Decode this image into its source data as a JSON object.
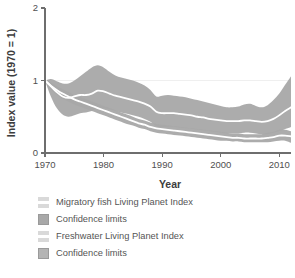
{
  "chart_data": {
    "type": "area",
    "title": "",
    "xlabel": "Year",
    "ylabel": "Index value (1970 = 1)",
    "xlim": [
      1970,
      2012
    ],
    "ylim": [
      0,
      2
    ],
    "xticks": [
      1970,
      1980,
      1990,
      2000,
      2010
    ],
    "xtick_labels": [
      "1970",
      "1980",
      "1990",
      "2000",
      "2010"
    ],
    "yticks": [
      0,
      1,
      2
    ],
    "ytick_labels": [
      "0",
      "1",
      "2"
    ],
    "grid": "horizontal-reference-line-at-1",
    "legend_position": "below",
    "reference_line_y": 1,
    "x": [
      1970,
      1971,
      1972,
      1973,
      1974,
      1975,
      1976,
      1977,
      1978,
      1979,
      1980,
      1981,
      1982,
      1983,
      1984,
      1985,
      1986,
      1987,
      1988,
      1989,
      1990,
      1991,
      1992,
      1993,
      1994,
      1995,
      1996,
      1997,
      1998,
      1999,
      2000,
      2001,
      2002,
      2003,
      2004,
      2005,
      2006,
      2007,
      2008,
      2009,
      2010,
      2011,
      2012
    ],
    "series": [
      {
        "name": "Migratory fish Living Planet Index",
        "type": "line",
        "color": "#ffffff",
        "values": [
          1.0,
          0.92,
          0.84,
          0.78,
          0.76,
          0.78,
          0.8,
          0.8,
          0.82,
          0.86,
          0.85,
          0.82,
          0.79,
          0.77,
          0.75,
          0.73,
          0.71,
          0.68,
          0.64,
          0.57,
          0.55,
          0.55,
          0.55,
          0.54,
          0.53,
          0.52,
          0.5,
          0.49,
          0.47,
          0.46,
          0.45,
          0.44,
          0.44,
          0.44,
          0.45,
          0.45,
          0.44,
          0.43,
          0.44,
          0.47,
          0.52,
          0.58,
          0.63
        ]
      },
      {
        "name": "Confidence limits",
        "type": "band",
        "for": "Migratory fish Living Planet Index",
        "color": "#a8a8a8",
        "lower": [
          1.0,
          0.78,
          0.62,
          0.53,
          0.5,
          0.52,
          0.55,
          0.56,
          0.58,
          0.62,
          0.62,
          0.6,
          0.58,
          0.56,
          0.54,
          0.52,
          0.5,
          0.47,
          0.43,
          0.37,
          0.36,
          0.36,
          0.36,
          0.35,
          0.34,
          0.33,
          0.32,
          0.31,
          0.3,
          0.29,
          0.28,
          0.27,
          0.27,
          0.27,
          0.28,
          0.28,
          0.27,
          0.26,
          0.26,
          0.28,
          0.3,
          0.33,
          0.36
        ],
        "upper": [
          1.0,
          1.02,
          0.99,
          0.96,
          0.96,
          1.0,
          1.06,
          1.12,
          1.18,
          1.21,
          1.18,
          1.12,
          1.07,
          1.04,
          1.02,
          1.0,
          0.97,
          0.93,
          0.87,
          0.78,
          0.79,
          0.8,
          0.79,
          0.78,
          0.77,
          0.75,
          0.73,
          0.71,
          0.69,
          0.67,
          0.65,
          0.63,
          0.63,
          0.64,
          0.67,
          0.68,
          0.65,
          0.63,
          0.66,
          0.73,
          0.82,
          0.94,
          1.06
        ]
      },
      {
        "name": "Freshwater Living Planet Index",
        "type": "line",
        "color": "#ffffff",
        "values": [
          1.0,
          0.93,
          0.87,
          0.82,
          0.78,
          0.74,
          0.71,
          0.68,
          0.65,
          0.62,
          0.59,
          0.56,
          0.53,
          0.5,
          0.47,
          0.44,
          0.41,
          0.39,
          0.36,
          0.34,
          0.33,
          0.32,
          0.31,
          0.3,
          0.29,
          0.28,
          0.27,
          0.26,
          0.25,
          0.24,
          0.23,
          0.22,
          0.21,
          0.21,
          0.2,
          0.2,
          0.2,
          0.2,
          0.21,
          0.22,
          0.24,
          0.24,
          0.23
        ]
      },
      {
        "name": "Confidence limits",
        "type": "band",
        "for": "Freshwater Living Planet Index",
        "color": "#a8a8a8",
        "lower": [
          1.0,
          0.88,
          0.81,
          0.75,
          0.71,
          0.67,
          0.64,
          0.61,
          0.58,
          0.55,
          0.52,
          0.49,
          0.46,
          0.43,
          0.4,
          0.38,
          0.35,
          0.33,
          0.3,
          0.28,
          0.27,
          0.26,
          0.25,
          0.24,
          0.23,
          0.22,
          0.21,
          0.2,
          0.19,
          0.18,
          0.17,
          0.17,
          0.16,
          0.16,
          0.15,
          0.15,
          0.15,
          0.15,
          0.15,
          0.16,
          0.17,
          0.17,
          0.14
        ],
        "upper": [
          1.0,
          0.97,
          0.92,
          0.88,
          0.84,
          0.8,
          0.77,
          0.74,
          0.71,
          0.68,
          0.65,
          0.62,
          0.59,
          0.56,
          0.53,
          0.5,
          0.47,
          0.45,
          0.42,
          0.4,
          0.39,
          0.38,
          0.37,
          0.36,
          0.35,
          0.34,
          0.33,
          0.32,
          0.31,
          0.3,
          0.29,
          0.28,
          0.27,
          0.27,
          0.26,
          0.26,
          0.26,
          0.26,
          0.28,
          0.29,
          0.32,
          0.32,
          0.3
        ]
      }
    ]
  },
  "axes": {
    "ylabel": "Index value (1970 = 1)",
    "xlabel": "Year",
    "ytick_0": "0",
    "ytick_1": "1",
    "ytick_2": "2",
    "xtick_0": "1970",
    "xtick_1": "1980",
    "xtick_2": "1990",
    "xtick_3": "2000",
    "xtick_4": "2010"
  },
  "legend": {
    "items": [
      {
        "label": "Migratory fish Living Planet Index",
        "swatch": "#e8e8e8",
        "kind": "line"
      },
      {
        "label": "Confidence limits",
        "swatch": "#a8a8a8",
        "kind": "band"
      },
      {
        "label": "Freshwater Living Planet Index",
        "swatch": "#e8e8e8",
        "kind": "line"
      },
      {
        "label": "Confidence limits",
        "swatch": "#b4b4b4",
        "kind": "band"
      }
    ]
  },
  "colors": {
    "band": "#a8a8a8",
    "line": "#ffffff",
    "axis": "#6e6e6e",
    "text": "#4f4f4f",
    "gridline": "#efefef",
    "background": "#ffffff"
  }
}
